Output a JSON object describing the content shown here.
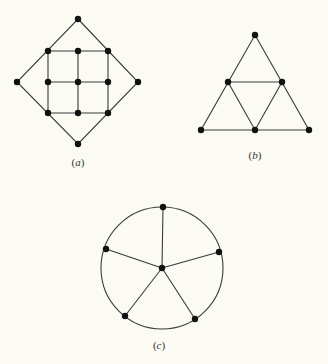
{
  "diagrams": [
    {
      "id": "a",
      "label_open": "(",
      "label_letter": "a",
      "label_close": ")",
      "caption": "(a)",
      "description": "3x3 grid graph inscribed in a diamond with four outer apex vertices",
      "nodes": [
        {
          "x": 78,
          "y": 19
        },
        {
          "x": 48,
          "y": 51
        },
        {
          "x": 78,
          "y": 51
        },
        {
          "x": 108,
          "y": 51
        },
        {
          "x": 17,
          "y": 82
        },
        {
          "x": 48,
          "y": 82
        },
        {
          "x": 78,
          "y": 82
        },
        {
          "x": 108,
          "y": 82
        },
        {
          "x": 138,
          "y": 82
        },
        {
          "x": 48,
          "y": 113
        },
        {
          "x": 78,
          "y": 113
        },
        {
          "x": 108,
          "y": 113
        },
        {
          "x": 78,
          "y": 144
        }
      ]
    },
    {
      "id": "b",
      "caption": "(b)",
      "description": "Triangle subdivided into four smaller triangles",
      "nodes": [
        {
          "x": 255,
          "y": 35
        },
        {
          "x": 228,
          "y": 82
        },
        {
          "x": 282,
          "y": 82
        },
        {
          "x": 201,
          "y": 130
        },
        {
          "x": 255,
          "y": 130
        },
        {
          "x": 309,
          "y": 130
        }
      ]
    },
    {
      "id": "c",
      "caption": "(c)",
      "description": "Wheel graph: circle with five rim vertices joined to a center vertex",
      "circle": {
        "cx": 162,
        "cy": 268,
        "r": 61
      },
      "nodes": [
        {
          "x": 163,
          "y": 207
        },
        {
          "x": 106,
          "y": 249
        },
        {
          "x": 219,
          "y": 252
        },
        {
          "x": 125,
          "y": 316
        },
        {
          "x": 195,
          "y": 319
        },
        {
          "x": 162,
          "y": 268
        }
      ]
    }
  ],
  "captions": {
    "a": "a",
    "b": "b",
    "c": "c"
  }
}
